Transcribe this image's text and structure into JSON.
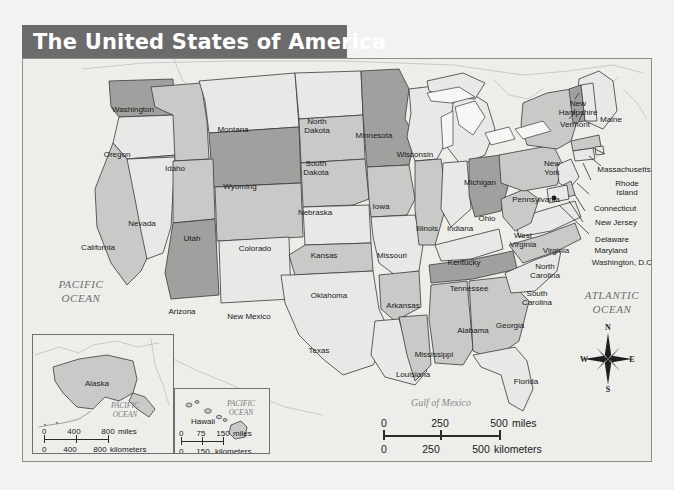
{
  "title": "The United States of America",
  "oceans": {
    "pacific": "PACIFIC\nOCEAN",
    "pacific_line1": "PACIFIC",
    "pacific_line2": "OCEAN",
    "atlantic_line1": "ATLANTIC",
    "atlantic_line2": "OCEAN",
    "gulf": "Gulf of Mexico"
  },
  "states": [
    {
      "name": "Washington",
      "label": "Washington",
      "x": 110,
      "y": 51,
      "shade": "dark"
    },
    {
      "name": "Oregon",
      "label": "Oregon",
      "x": 94,
      "y": 96,
      "shade": "light"
    },
    {
      "name": "California",
      "label": "California",
      "x": 75,
      "y": 189,
      "shade": "mid"
    },
    {
      "name": "Nevada",
      "label": "Nevada",
      "x": 119,
      "y": 165,
      "shade": "light"
    },
    {
      "name": "Idaho",
      "label": "Idaho",
      "x": 152,
      "y": 110,
      "shade": "mid"
    },
    {
      "name": "Montana",
      "label": "Montana",
      "x": 210,
      "y": 71,
      "shade": "light"
    },
    {
      "name": "Wyoming",
      "label": "Wyoming",
      "x": 217,
      "y": 128,
      "shade": "dark"
    },
    {
      "name": "Utah",
      "label": "Utah",
      "x": 169,
      "y": 180,
      "shade": "mid"
    },
    {
      "name": "Colorado",
      "label": "Colorado",
      "x": 232,
      "y": 190,
      "shade": "mid"
    },
    {
      "name": "Arizona",
      "label": "Arizona",
      "x": 159,
      "y": 253,
      "shade": "dark"
    },
    {
      "name": "New Mexico",
      "label": "New Mexico",
      "x": 226,
      "y": 258,
      "shade": "light"
    },
    {
      "name": "North Dakota",
      "label": "North\nDakota",
      "x": 294,
      "y": 68,
      "shade": "light"
    },
    {
      "name": "South Dakota",
      "label": "South\nDakota",
      "x": 293,
      "y": 110,
      "shade": "mid"
    },
    {
      "name": "Nebraska",
      "label": "Nebraska",
      "x": 292,
      "y": 154,
      "shade": "mid"
    },
    {
      "name": "Kansas",
      "label": "Kansas",
      "x": 301,
      "y": 197,
      "shade": "light"
    },
    {
      "name": "Oklahoma",
      "label": "Oklahoma",
      "x": 306,
      "y": 237,
      "shade": "mid"
    },
    {
      "name": "Texas",
      "label": "Texas",
      "x": 296,
      "y": 292,
      "shade": "light"
    },
    {
      "name": "Minnesota",
      "label": "Minnesota",
      "x": 351,
      "y": 77,
      "shade": "dark"
    },
    {
      "name": "Iowa",
      "label": "Iowa",
      "x": 358,
      "y": 148,
      "shade": "mid"
    },
    {
      "name": "Missouri",
      "label": "Missouri",
      "x": 369,
      "y": 197,
      "shade": "light"
    },
    {
      "name": "Arkansas",
      "label": "Arkansas",
      "x": 380,
      "y": 247,
      "shade": "mid"
    },
    {
      "name": "Louisiana",
      "label": "Louisiana",
      "x": 390,
      "y": 316,
      "shade": "light"
    },
    {
      "name": "Mississippi",
      "label": "Mississippi",
      "x": 411,
      "y": 296,
      "shade": "mid"
    },
    {
      "name": "Wisconsin",
      "label": "Wisconsin",
      "x": 392,
      "y": 96,
      "shade": "light"
    },
    {
      "name": "Illinois",
      "label": "Illinois",
      "x": 404,
      "y": 170,
      "shade": "mid"
    },
    {
      "name": "Michigan",
      "label": "Michigan",
      "x": 457,
      "y": 124,
      "shade": "light"
    },
    {
      "name": "Indiana",
      "label": "Indiana",
      "x": 437,
      "y": 170,
      "shade": "light"
    },
    {
      "name": "Ohio",
      "label": "Ohio",
      "x": 464,
      "y": 160,
      "shade": "dark"
    },
    {
      "name": "Kentucky",
      "label": "Kentucky",
      "x": 441,
      "y": 204,
      "shade": "light"
    },
    {
      "name": "Tennessee",
      "label": "Tennessee",
      "x": 446,
      "y": 230,
      "shade": "dark"
    },
    {
      "name": "Alabama",
      "label": "Alabama",
      "x": 450,
      "y": 272,
      "shade": "mid"
    },
    {
      "name": "Georgia",
      "label": "Georgia",
      "x": 487,
      "y": 267,
      "shade": "mid"
    },
    {
      "name": "Florida",
      "label": "Florida",
      "x": 503,
      "y": 323,
      "shade": "light"
    },
    {
      "name": "South Carolina",
      "label": "South\nCarolina",
      "x": 514,
      "y": 240,
      "shade": "light"
    },
    {
      "name": "North Carolina",
      "label": "North\nCarolina",
      "x": 522,
      "y": 213,
      "shade": "mid"
    },
    {
      "name": "Virginia",
      "label": "Virginia",
      "x": 533,
      "y": 192,
      "shade": "light"
    },
    {
      "name": "West Virginia",
      "label": "West\nVirginia",
      "x": 500,
      "y": 182,
      "shade": "mid"
    },
    {
      "name": "Pennsylvania",
      "label": "Pennsylvania",
      "x": 513,
      "y": 141,
      "shade": "mid"
    },
    {
      "name": "New York",
      "label": "New\nYork",
      "x": 529,
      "y": 110,
      "shade": "mid"
    },
    {
      "name": "Maine",
      "label": "Maine",
      "x": 588,
      "y": 61,
      "shade": "light"
    }
  ],
  "callouts": [
    {
      "name": "New Hampshire",
      "label": "New\nHampshire",
      "x": 555,
      "y": 50
    },
    {
      "name": "Vermont",
      "label": "Vermont",
      "x": 552,
      "y": 66
    },
    {
      "name": "Massachusetts",
      "label": "Massachusetts",
      "x": 601,
      "y": 111
    },
    {
      "name": "Rhode Island",
      "label": "Rhode\nIsland",
      "x": 604,
      "y": 130
    },
    {
      "name": "Connecticut",
      "label": "Connecticut",
      "x": 592,
      "y": 150
    },
    {
      "name": "New Jersey",
      "label": "New Jersey",
      "x": 593,
      "y": 164
    },
    {
      "name": "Delaware",
      "label": "Delaware",
      "x": 589,
      "y": 181
    },
    {
      "name": "Maryland",
      "label": "Maryland",
      "x": 588,
      "y": 192
    },
    {
      "name": "Washington, D.C.",
      "label": "Washington, D.C.",
      "x": 600,
      "y": 204
    }
  ],
  "insets": {
    "alaska": {
      "title": "Alaska",
      "ocean_line1": "PACIFIC",
      "ocean_line2": "OCEAN",
      "scale_miles": {
        "ticks": [
          "0",
          "400",
          "800"
        ],
        "unit": "miles"
      },
      "scale_km": {
        "ticks": [
          "0",
          "400",
          "800"
        ],
        "unit": "kilometers"
      }
    },
    "hawaii": {
      "title": "Hawaii",
      "ocean_line1": "PACIFIC",
      "ocean_line2": "OCEAN",
      "scale_miles": {
        "ticks": [
          "0",
          "75",
          "150"
        ],
        "unit": "miles"
      },
      "scale_km": {
        "ticks": [
          "0",
          "150"
        ],
        "unit": "kilometers"
      }
    }
  },
  "scale_main": {
    "miles": {
      "ticks": [
        "0",
        "250",
        "500"
      ],
      "unit": "miles"
    },
    "km": {
      "ticks": [
        "0",
        "250",
        "500"
      ],
      "unit": "kilometers"
    }
  },
  "compass": {
    "n": "N",
    "e": "E",
    "s": "S",
    "w": "W"
  },
  "colors": {
    "title_bar": "#6b6b6b",
    "title_text": "#ffffff",
    "map_bg": "#ededea",
    "state_light": "#e8e8e6",
    "state_mid": "#c9c9c7",
    "state_dark": "#a0a09e",
    "border": "#3a3a3a",
    "ocean_text": "#6e6e6e"
  }
}
